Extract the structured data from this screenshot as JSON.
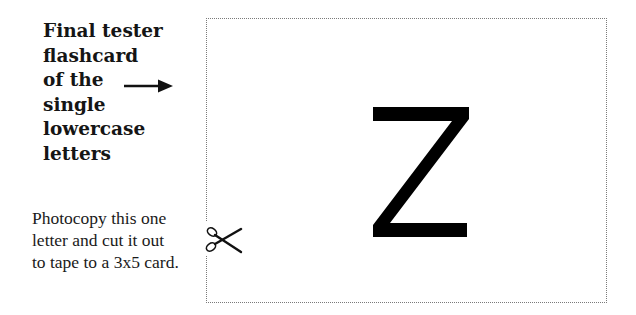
{
  "title": {
    "lines": [
      "Final tester",
      "flashcard",
      "of the",
      "single",
      "lowercase",
      "letters"
    ]
  },
  "pointer": {
    "icon": "arrow-right-icon"
  },
  "instructions": {
    "lines": [
      "Photocopy this one",
      "letter and cut it out",
      "to tape to a 3x5 card."
    ]
  },
  "card": {
    "letter": "z",
    "border_style": "dotted",
    "cut_icon": "scissors-icon"
  },
  "colors": {
    "text": "#151515",
    "letter": "#000000",
    "border": "#7a7a7a",
    "background": "#ffffff"
  }
}
